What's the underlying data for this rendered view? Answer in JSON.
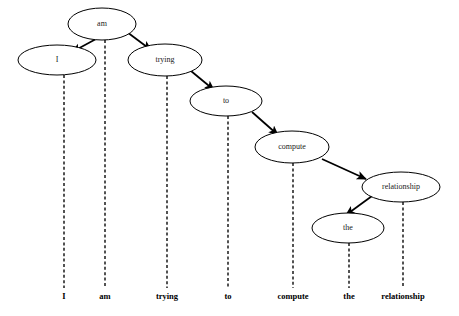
{
  "diagram": {
    "sentence": "I am trying to compute the relationship",
    "background_color": "#ffffff",
    "stroke_color": "#000000",
    "text_color": "#1a1a1a"
  },
  "nodes": [
    {
      "id": "am",
      "label": "am",
      "cx": 102,
      "cy": 24,
      "rx": 34,
      "ry": 16
    },
    {
      "id": "I",
      "label": "I",
      "cx": 57,
      "cy": 60,
      "rx": 39,
      "ry": 15
    },
    {
      "id": "trying",
      "label": "trying",
      "cx": 165,
      "cy": 60,
      "rx": 37,
      "ry": 16
    },
    {
      "id": "to",
      "label": "to",
      "cx": 226,
      "cy": 101,
      "rx": 36,
      "ry": 15
    },
    {
      "id": "compute",
      "label": "compute",
      "cx": 292,
      "cy": 147,
      "rx": 37,
      "ry": 16
    },
    {
      "id": "relationship",
      "label": "relationship",
      "cx": 401,
      "cy": 187,
      "rx": 39,
      "ry": 15
    },
    {
      "id": "the",
      "label": "the",
      "cx": 348,
      "cy": 228,
      "rx": 36,
      "ry": 15
    }
  ],
  "edges": [
    {
      "id": "am-I",
      "from": "am",
      "to": "I",
      "x1": 96,
      "y1": 39,
      "x2": 72,
      "y2": 52
    },
    {
      "id": "am-trying",
      "from": "am",
      "to": "trying",
      "x1": 127,
      "y1": 32,
      "x2": 151,
      "y2": 50
    },
    {
      "id": "trying-to",
      "from": "trying",
      "to": "to",
      "x1": 191,
      "y1": 71,
      "x2": 214,
      "y2": 90
    },
    {
      "id": "to-compute",
      "from": "to",
      "to": "compute",
      "x1": 252,
      "y1": 112,
      "x2": 278,
      "y2": 135
    },
    {
      "id": "compute-relationship",
      "from": "compute",
      "to": "relationship",
      "x1": 322,
      "y1": 159,
      "x2": 366,
      "y2": 179
    },
    {
      "id": "relationship-the",
      "from": "relationship",
      "to": "the",
      "x1": 372,
      "y1": 196,
      "x2": 346,
      "y2": 215
    }
  ],
  "drop_lines": [
    {
      "id": "drop-I",
      "x": 64,
      "y1": 75,
      "y2": 288
    },
    {
      "id": "drop-am",
      "x": 105,
      "y1": 40,
      "y2": 288
    },
    {
      "id": "drop-trying",
      "x": 167,
      "y1": 76,
      "y2": 288
    },
    {
      "id": "drop-to",
      "x": 228,
      "y1": 116,
      "y2": 288
    },
    {
      "id": "drop-compute",
      "x": 293,
      "y1": 163,
      "y2": 288
    },
    {
      "id": "drop-the",
      "x": 349,
      "y1": 243,
      "y2": 288
    },
    {
      "id": "drop-relationship",
      "x": 403,
      "y1": 202,
      "y2": 288
    }
  ],
  "word_labels": [
    {
      "id": "word-I",
      "label": "I",
      "x": 64,
      "y": 299
    },
    {
      "id": "word-am",
      "label": "am",
      "x": 105,
      "y": 299
    },
    {
      "id": "word-trying",
      "label": "trying",
      "x": 167,
      "y": 299
    },
    {
      "id": "word-to",
      "label": "to",
      "x": 228,
      "y": 299
    },
    {
      "id": "word-compute",
      "label": "compute",
      "x": 293,
      "y": 299
    },
    {
      "id": "word-the",
      "label": "the",
      "x": 349,
      "y": 299
    },
    {
      "id": "word-relationship",
      "label": "relationship",
      "x": 403,
      "y": 299
    }
  ]
}
